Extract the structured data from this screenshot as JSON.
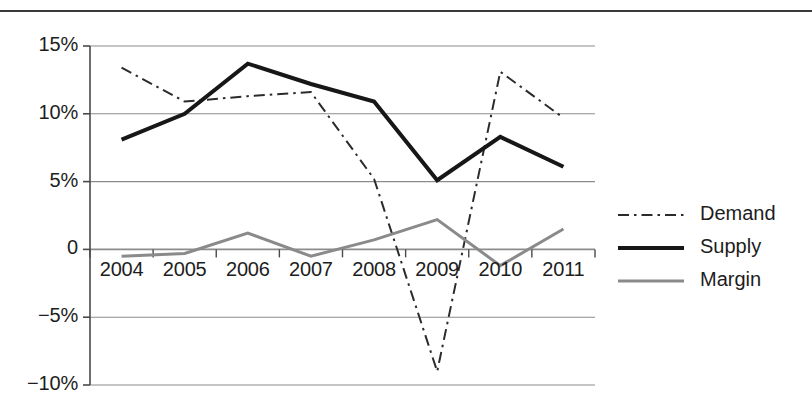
{
  "chart_data": {
    "type": "line",
    "title": "",
    "subtitle": "",
    "xlabel": "",
    "ylabel": "",
    "categories": [
      "2004",
      "2005",
      "2006",
      "2007",
      "2008",
      "2009",
      "2010",
      "2011"
    ],
    "ylim": [
      -10,
      15
    ],
    "ytick_values": [
      15,
      10,
      5,
      0,
      -5,
      -10
    ],
    "ytick_labels": [
      "15%",
      "10%",
      "5%",
      "0",
      "−5%",
      "−10%"
    ],
    "grid": "horizontal",
    "legend_position": "right",
    "series": [
      {
        "name": "Demand",
        "style": "dash-dot",
        "color": "#2b2b2b",
        "width": 2,
        "values": [
          13.4,
          10.9,
          11.3,
          11.6,
          5.2,
          -9.0,
          13.1,
          9.7
        ]
      },
      {
        "name": "Supply",
        "style": "solid",
        "color": "#171717",
        "width": 4,
        "values": [
          8.1,
          10.0,
          13.7,
          12.2,
          10.9,
          5.1,
          8.3,
          6.1
        ]
      },
      {
        "name": "Margin",
        "style": "solid",
        "color": "#8a8a8a",
        "width": 3,
        "values": [
          -0.5,
          -0.3,
          1.2,
          -0.5,
          0.7,
          2.2,
          -1.2,
          1.5
        ]
      }
    ]
  },
  "axis": {
    "y_labels": [
      "15%",
      "10%",
      "5%",
      "0",
      "−5%",
      "−10%"
    ],
    "x_labels": [
      "2004",
      "2005",
      "2006",
      "2007",
      "2008",
      "2009",
      "2010",
      "2011"
    ]
  },
  "legend": {
    "items": [
      {
        "label": "Demand",
        "swatch": "dash-dot-line-swatch"
      },
      {
        "label": "Supply",
        "swatch": "solid-black-line-swatch"
      },
      {
        "label": "Margin",
        "swatch": "solid-gray-line-swatch"
      }
    ]
  },
  "colors": {
    "demand": "#2b2b2b",
    "supply": "#171717",
    "margin": "#8a8a8a",
    "grid": "#8c8c8c",
    "axis": "#4a4a4a",
    "rule": "#3a3a3a"
  }
}
